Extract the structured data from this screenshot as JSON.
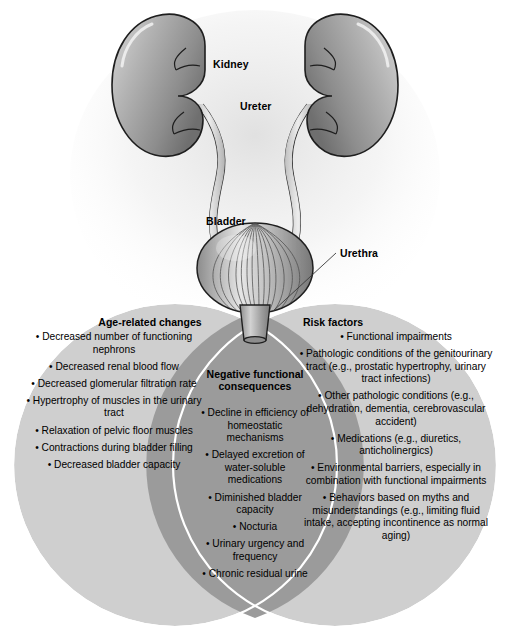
{
  "figure": {
    "colors": {
      "circle_fill": "#cfcfcf",
      "overlap_fill": "#9b9b9b",
      "outline": "#ffffff",
      "organ_dark": "#7a7a7a",
      "organ_light": "#e2e2e2",
      "text": "#000000",
      "background": "#ffffff"
    }
  },
  "anatomy": {
    "labels": [
      {
        "name": "kidney",
        "text": "Kidney"
      },
      {
        "name": "ureter",
        "text": "Ureter"
      },
      {
        "name": "bladder",
        "text": "Bladder"
      },
      {
        "name": "urethra",
        "text": "Urethra"
      }
    ]
  },
  "venn": {
    "left": {
      "heading": "Age-related changes",
      "items": [
        "• Decreased number of functioning nephrons",
        "• Decreased renal blood flow",
        "• Decreased glomerular filtration rate",
        "• Hypertrophy of muscles in the urinary tract",
        "• Relaxation of pelvic floor muscles",
        "• Contractions during bladder filling",
        "• Decreased bladder capacity"
      ]
    },
    "center": {
      "heading": "Negative functional consequences",
      "items": [
        "• Decline in efficiency of homeostatic mechanisms",
        "• Delayed excretion of water-soluble medications",
        "• Diminished bladder capacity",
        "• Nocturia",
        "• Urinary urgency and frequency",
        "• Chronic residual urine"
      ]
    },
    "right": {
      "heading": "Risk factors",
      "items": [
        "• Functional impairments",
        "• Pathologic conditions of the genitourinary tract (e.g., prostatic hypertrophy, urinary tract infections)",
        "• Other pathologic conditions (e.g., dehydration, dementia, cerebrovascular accident)",
        "• Medications (e.g., diuretics, anticholinergics)",
        "• Environmental barriers, especially in combination with functional impairments",
        "• Behaviors based on myths and misunderstandings (e.g., limiting fluid intake, accepting incontinence as normal aging)"
      ]
    }
  }
}
